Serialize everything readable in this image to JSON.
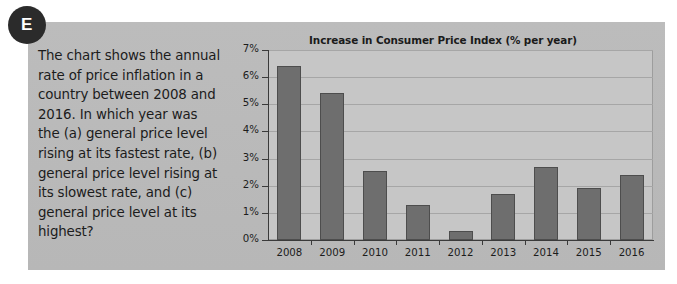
{
  "badge": {
    "letter": "E"
  },
  "question": {
    "text": "The chart shows the annual rate of price inflation in a country between 2008 and 2016. In which year was the (a) general price level rising at its fastest rate, (b) general price level rising at its slowest rate, and (c) general price level at its highest?"
  },
  "colors": {
    "panel_background": "#b9b9b9",
    "plot_background": "#c6c6c6",
    "bar_fill": "#6e6e6e",
    "bar_stroke": "#4d4d4d",
    "axis": "#3a3a3a",
    "gridline": "#a6a6a6",
    "badge_background": "#2b2b2b",
    "text": "#1c1c1c"
  },
  "chart_data": {
    "type": "bar",
    "title": "Increase in Consumer Price Index (% per year)",
    "xlabel": "",
    "ylabel": "",
    "categories": [
      "2008",
      "2009",
      "2010",
      "2011",
      "2012",
      "2013",
      "2014",
      "2015",
      "2016"
    ],
    "values": [
      6.4,
      5.4,
      2.55,
      1.3,
      0.35,
      1.7,
      2.7,
      1.9,
      2.4
    ],
    "ylim": [
      0,
      7
    ],
    "ytick_step": 1,
    "ytick_labels": [
      "0%",
      "1%",
      "2%",
      "3%",
      "4%",
      "5%",
      "6%",
      "7%"
    ],
    "grid": true,
    "legend": false
  }
}
